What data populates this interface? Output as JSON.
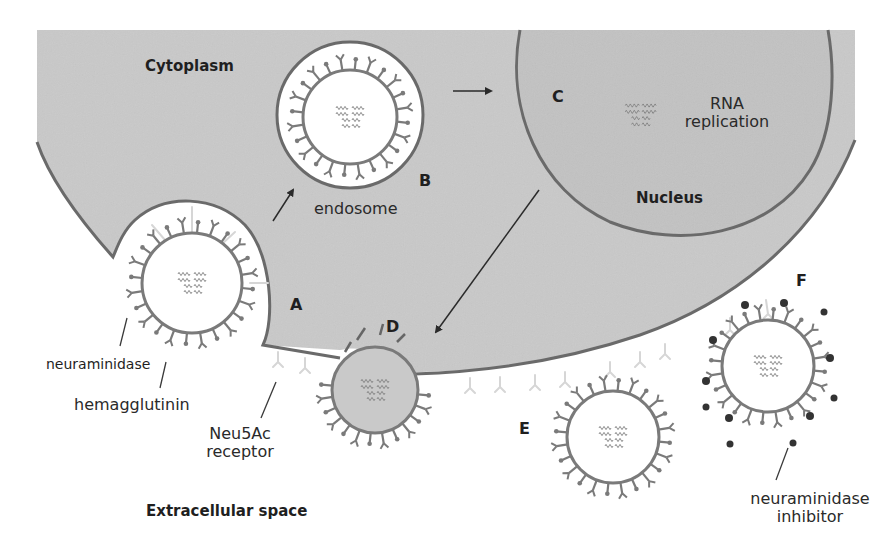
{
  "colors": {
    "cytoplasm": "#c9c9c9",
    "nucleus": "#c2c2c2",
    "membrane": "#6a6a6a",
    "virus_envelope": "#7a7a7a",
    "receptor": "#d6d6d6",
    "inhibitor": "#3a3a3a",
    "text": "#1f1f1f",
    "background": "#ffffff"
  },
  "regions": {
    "cytoplasm": "Cytoplasm",
    "nucleus": "Nucleus",
    "extracellular": "Extracellular space"
  },
  "stages": {
    "A": "A",
    "B": "B",
    "C": "C",
    "D": "D",
    "E": "E",
    "F": "F"
  },
  "labels": {
    "endosome": "endosome",
    "rna_line1": "RNA",
    "rna_line2": "replication",
    "neuraminidase": "neuraminidase",
    "hemagglutinin": "hemagglutinin",
    "receptor_line1": "Neu5Ac",
    "receptor_line2": "receptor",
    "inhibitor_line1": "neuraminidase",
    "inhibitor_line2": "inhibitor"
  },
  "viruses": [
    {
      "id": "A",
      "cx": 192,
      "cy": 283,
      "r": 50,
      "fill": "#ffffff"
    },
    {
      "id": "B",
      "cx": 350,
      "cy": 117,
      "r": 47,
      "fill": "#ffffff"
    },
    {
      "id": "D",
      "cx": 375,
      "cy": 390,
      "r": 43,
      "fill": "#c9c9c9"
    },
    {
      "id": "E",
      "cx": 613,
      "cy": 437,
      "r": 46,
      "fill": "#ffffff"
    },
    {
      "id": "F",
      "cx": 768,
      "cy": 366,
      "r": 46,
      "fill": "#ffffff"
    }
  ]
}
